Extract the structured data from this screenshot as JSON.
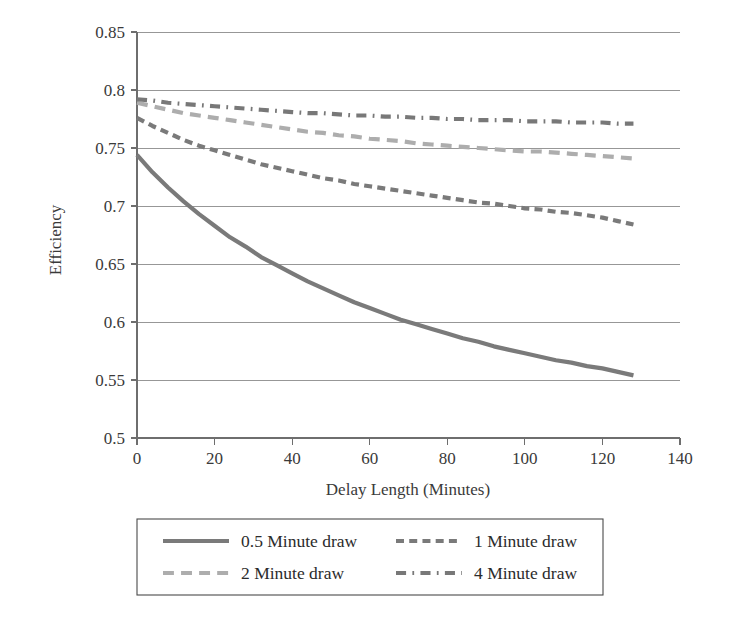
{
  "chart_data": {
    "type": "line",
    "title": "",
    "xlabel": "Delay Length (Minutes)",
    "ylabel": "Efficiency",
    "xlim": [
      0,
      140
    ],
    "ylim": [
      0.5,
      0.85
    ],
    "xticks": [
      0,
      20,
      40,
      60,
      80,
      100,
      120,
      140
    ],
    "xtick_labels": [
      "0",
      "20",
      "40",
      "60",
      "80",
      "100",
      "120",
      "140"
    ],
    "yticks": [
      0.5,
      0.55,
      0.6,
      0.65,
      0.7,
      0.75,
      0.8,
      0.85
    ],
    "ytick_labels": [
      "0.5",
      "0.55",
      "0.6",
      "0.65",
      "0.7",
      "0.75",
      "0.8",
      "0.85"
    ],
    "grid": "horizontal",
    "legend_position": "bottom",
    "x": [
      0,
      4,
      8,
      12,
      16,
      20,
      24,
      28,
      32,
      36,
      40,
      44,
      48,
      52,
      56,
      60,
      64,
      68,
      72,
      76,
      80,
      84,
      88,
      92,
      96,
      100,
      104,
      108,
      112,
      116,
      120,
      124,
      128
    ],
    "series": [
      {
        "name": "0.5 Minute draw",
        "style": "solid",
        "color": "#7a7a7a",
        "width": 4.2,
        "values": [
          0.744,
          0.729,
          0.716,
          0.704,
          0.693,
          0.683,
          0.673,
          0.665,
          0.656,
          0.649,
          0.642,
          0.635,
          0.629,
          0.623,
          0.617,
          0.612,
          0.607,
          0.602,
          0.598,
          0.594,
          0.59,
          0.586,
          0.583,
          0.579,
          0.576,
          0.573,
          0.57,
          0.567,
          0.565,
          0.562,
          0.56,
          0.557,
          0.554
        ]
      },
      {
        "name": "1 Minute draw",
        "style": "dashed",
        "color": "#7a7a7a",
        "width": 4.2,
        "values": [
          0.776,
          0.769,
          0.763,
          0.757,
          0.752,
          0.748,
          0.744,
          0.74,
          0.736,
          0.733,
          0.73,
          0.727,
          0.724,
          0.722,
          0.719,
          0.717,
          0.715,
          0.713,
          0.711,
          0.709,
          0.707,
          0.705,
          0.703,
          0.702,
          0.7,
          0.698,
          0.697,
          0.695,
          0.694,
          0.692,
          0.69,
          0.687,
          0.684
        ]
      },
      {
        "name": "2 Minute draw",
        "style": "longdash",
        "color": "#adadad",
        "width": 4.2,
        "values": [
          0.789,
          0.786,
          0.783,
          0.78,
          0.778,
          0.776,
          0.774,
          0.772,
          0.77,
          0.768,
          0.766,
          0.764,
          0.763,
          0.761,
          0.76,
          0.758,
          0.757,
          0.756,
          0.754,
          0.753,
          0.752,
          0.751,
          0.75,
          0.749,
          0.748,
          0.747,
          0.747,
          0.746,
          0.745,
          0.744,
          0.743,
          0.742,
          0.741
        ]
      },
      {
        "name": "4 Minute draw",
        "style": "dashdot",
        "color": "#787878",
        "width": 4.2,
        "values": [
          0.792,
          0.791,
          0.789,
          0.788,
          0.787,
          0.786,
          0.785,
          0.784,
          0.783,
          0.782,
          0.781,
          0.78,
          0.78,
          0.779,
          0.778,
          0.778,
          0.777,
          0.777,
          0.776,
          0.776,
          0.775,
          0.775,
          0.774,
          0.774,
          0.774,
          0.773,
          0.773,
          0.773,
          0.772,
          0.772,
          0.772,
          0.771,
          0.771
        ]
      }
    ]
  },
  "legend": {
    "entries": [
      {
        "label": "0.5 Minute draw"
      },
      {
        "label": "1 Minute draw"
      },
      {
        "label": "2 Minute draw"
      },
      {
        "label": "4 Minute draw"
      }
    ]
  }
}
